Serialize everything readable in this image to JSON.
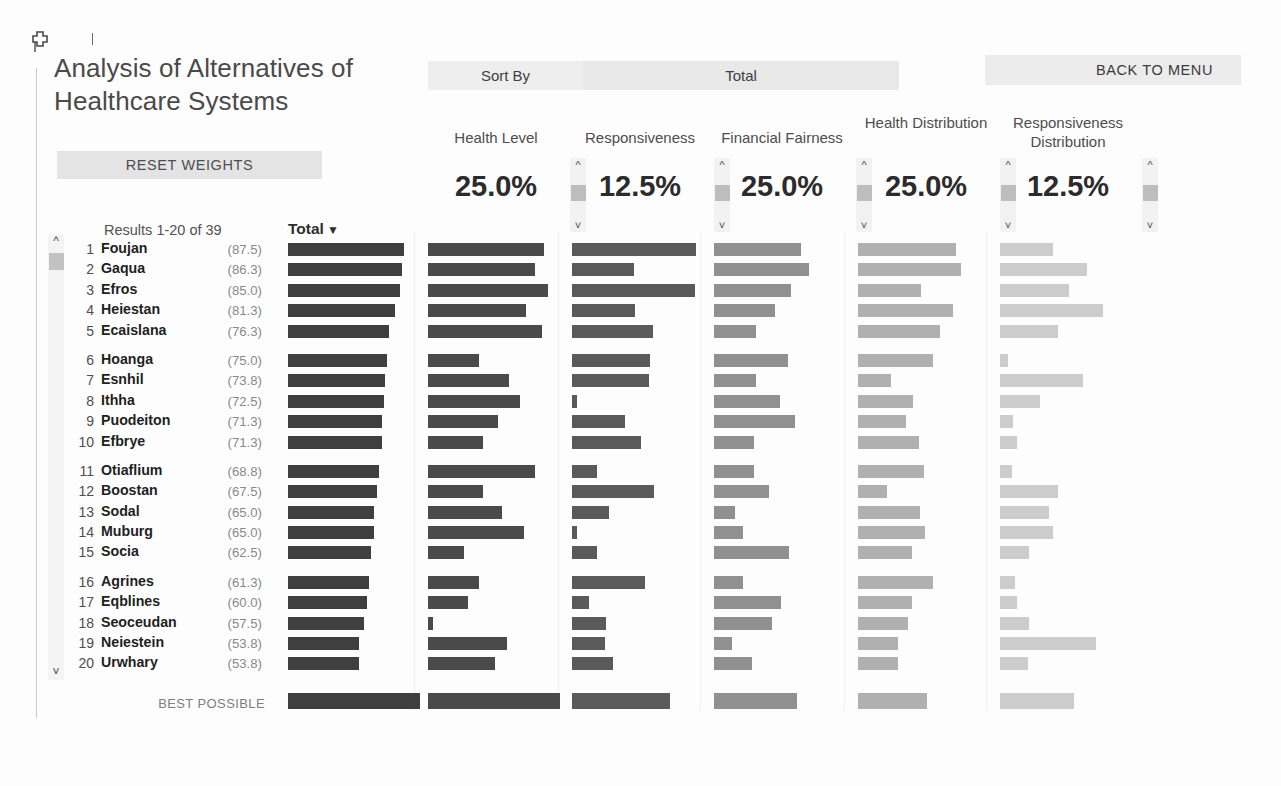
{
  "window": {
    "pin_icon": "pin-icon"
  },
  "header": {
    "title": "Analysis of Alternatives of Healthcare Systems",
    "reset_weights_label": "RESET WEIGHTS",
    "sort_by_label": "Sort By",
    "sort_by_value": "Total",
    "back_to_menu_label": "BACK TO MENU"
  },
  "list": {
    "results_count": "Results 1-20 of 39",
    "total_header": "Total",
    "total_sort_caret": "▼",
    "best_possible_label": "BEST POSSIBLE",
    "scroll_up_icon": "chevron-up-icon",
    "scroll_down_icon": "chevron-down-icon"
  },
  "criteria": [
    {
      "name": "Health Level",
      "weight": "25.0%",
      "color": "#4a4a4a"
    },
    {
      "name": "Responsiveness",
      "weight": "12.5%",
      "color": "#5a5a5a"
    },
    {
      "name": "Financial Fairness",
      "weight": "25.0%",
      "color": "#909090"
    },
    {
      "name": "Health Distribution",
      "weight": "25.0%",
      "color": "#b0b0b0"
    },
    {
      "name": "Responsiveness Distribution",
      "weight": "12.5%",
      "color": "#cccccc"
    }
  ],
  "chart_data": {
    "type": "bar",
    "title": "Analysis of Alternatives of Healthcare Systems",
    "xlabel": "",
    "ylabel": "",
    "sorted_by": "Total",
    "sort_direction": "descending",
    "scale_max": 100,
    "series": [
      {
        "name": "Total",
        "color": "#3f3f3f",
        "weight": "100%"
      },
      {
        "name": "Health Level",
        "color": "#4a4a4a",
        "weight": "25.0%"
      },
      {
        "name": "Responsiveness",
        "color": "#5a5a5a",
        "weight": "12.5%"
      },
      {
        "name": "Financial Fairness",
        "color": "#909090",
        "weight": "25.0%"
      },
      {
        "name": "Health Distribution",
        "color": "#b0b0b0",
        "weight": "25.0%"
      },
      {
        "name": "Responsiveness Distribution",
        "color": "#cccccc",
        "weight": "12.5%"
      }
    ],
    "categories": [
      "Foujan",
      "Gaqua",
      "Efros",
      "Heiestan",
      "Ecaislana",
      "Hoanga",
      "Esnhil",
      "Ithha",
      "Puodeiton",
      "Efbrye",
      "Otiaflium",
      "Boostan",
      "Sodal",
      "Muburg",
      "Socia",
      "Agrines",
      "Eqblines",
      "Seoceudan",
      "Neiestein",
      "Urwhary"
    ],
    "rows": [
      {
        "rank": 1,
        "name": "Foujan",
        "total": 87.5,
        "values": [
          88,
          94,
          66,
          74,
          40
        ]
      },
      {
        "rank": 2,
        "name": "Gaqua",
        "total": 86.3,
        "values": [
          81,
          47,
          72,
          78,
          66
        ]
      },
      {
        "rank": 3,
        "name": "Efros",
        "total": 85.0,
        "values": [
          91,
          93,
          58,
          48,
          52
        ]
      },
      {
        "rank": 4,
        "name": "Heiestan",
        "total": 81.3,
        "values": [
          74,
          48,
          46,
          72,
          78
        ]
      },
      {
        "rank": 5,
        "name": "Ecaislana",
        "total": 76.3,
        "values": [
          86,
          61,
          32,
          62,
          44
        ]
      },
      {
        "rank": 6,
        "name": "Hoanga",
        "total": 75.0,
        "values": [
          39,
          59,
          56,
          57,
          6
        ]
      },
      {
        "rank": 7,
        "name": "Esnhil",
        "total": 73.8,
        "values": [
          61,
          58,
          32,
          25,
          63
        ]
      },
      {
        "rank": 8,
        "name": "Ithha",
        "total": 72.5,
        "values": [
          70,
          4,
          50,
          42,
          30
        ]
      },
      {
        "rank": 9,
        "name": "Puodeiton",
        "total": 71.3,
        "values": [
          53,
          40,
          61,
          36,
          10
        ]
      },
      {
        "rank": 10,
        "name": "Efbrye",
        "total": 71.3,
        "values": [
          42,
          52,
          30,
          46,
          13
        ]
      },
      {
        "rank": 11,
        "name": "Otiaflium",
        "total": 68.8,
        "values": [
          81,
          19,
          30,
          50,
          9
        ]
      },
      {
        "rank": 12,
        "name": "Boostan",
        "total": 67.5,
        "values": [
          42,
          62,
          42,
          22,
          44
        ]
      },
      {
        "rank": 13,
        "name": "Sodal",
        "total": 65.0,
        "values": [
          56,
          28,
          16,
          47,
          37
        ]
      },
      {
        "rank": 14,
        "name": "Muburg",
        "total": 65.0,
        "values": [
          73,
          4,
          22,
          51,
          40
        ]
      },
      {
        "rank": 15,
        "name": "Socia",
        "total": 62.5,
        "values": [
          27,
          19,
          57,
          41,
          22
        ]
      },
      {
        "rank": 16,
        "name": "Agrines",
        "total": 61.3,
        "values": [
          39,
          55,
          22,
          57,
          11
        ]
      },
      {
        "rank": 17,
        "name": "Eqblines",
        "total": 60.0,
        "values": [
          30,
          13,
          51,
          41,
          13
        ]
      },
      {
        "rank": 18,
        "name": "Seoceudan",
        "total": 57.5,
        "values": [
          4,
          26,
          44,
          38,
          22
        ]
      },
      {
        "rank": 19,
        "name": "Neiestein",
        "total": 53.8,
        "values": [
          60,
          25,
          14,
          30,
          73
        ]
      },
      {
        "rank": 20,
        "name": "Urwhary",
        "total": 53.8,
        "values": [
          51,
          31,
          29,
          30,
          21
        ]
      }
    ],
    "best_possible": {
      "label": "BEST POSSIBLE",
      "total": 100,
      "values": [
        100,
        74,
        63,
        52,
        56
      ]
    }
  }
}
